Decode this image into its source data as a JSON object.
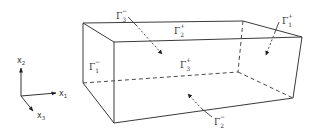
{
  "figure": {
    "type": "3D rectangular box with labelled boundary faces",
    "axes": {
      "x1": {
        "label": "x",
        "index": "1"
      },
      "x2": {
        "label": "x",
        "index": "2"
      },
      "x3": {
        "label": "x",
        "index": "3"
      }
    },
    "faces": [
      {
        "id": "gamma-3-minus",
        "symbol": "Γ",
        "sub": "3",
        "sup": "−",
        "face": "back (x3 min)"
      },
      {
        "id": "gamma-2-plus",
        "symbol": "Γ",
        "sub": "2",
        "sup": "+",
        "face": "top (x2 max)"
      },
      {
        "id": "gamma-1-plus",
        "symbol": "Γ",
        "sub": "1",
        "sup": "+",
        "face": "right (x1 max)"
      },
      {
        "id": "gamma-1-minus",
        "symbol": "Γ",
        "sub": "1",
        "sup": "−",
        "face": "left (x1 min)"
      },
      {
        "id": "gamma-3-plus",
        "symbol": "Γ",
        "sub": "3",
        "sup": "+",
        "face": "front (x3 max)"
      },
      {
        "id": "gamma-2-minus",
        "symbol": "Γ",
        "sub": "2",
        "sup": "−",
        "face": "bottom (x2 min)"
      }
    ]
  }
}
